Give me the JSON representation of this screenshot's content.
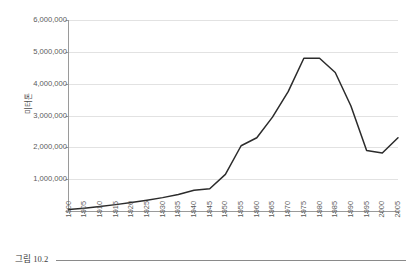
{
  "figure": {
    "caption_label": "그림 10.2",
    "background_color": "#ffffff",
    "line_color": "#2b2b2b",
    "grid_color": "#e2e2e2",
    "axis_color": "#9a9a9a",
    "tick_text_color": "#5a5a5a"
  },
  "chart_data": {
    "type": "line",
    "title": "",
    "subtitle": "",
    "xlabel": "",
    "ylabel": "미터톤",
    "xlim": [
      1900,
      2005
    ],
    "ylim": [
      0,
      6000000
    ],
    "grid": true,
    "legend": false,
    "legend_position": "none",
    "y_ticks": [
      0,
      1000000,
      2000000,
      3000000,
      4000000,
      5000000,
      6000000
    ],
    "y_tick_labels": [
      "",
      "1,000,000",
      "2,000,000",
      "3,000,000",
      "4,000,000",
      "5,000,000",
      "6,000,000"
    ],
    "x": [
      1900,
      1905,
      1910,
      1915,
      1920,
      1925,
      1930,
      1935,
      1940,
      1945,
      1950,
      1955,
      1960,
      1965,
      1970,
      1975,
      1980,
      1985,
      1990,
      1995,
      2000,
      2005
    ],
    "categories": [
      "1900",
      "1905",
      "1910",
      "1915",
      "1920",
      "1925",
      "1930",
      "1935",
      "1940",
      "1945",
      "1950",
      "1955",
      "1960",
      "1965",
      "1970",
      "1975",
      "1980",
      "1985",
      "1990",
      "1995",
      "2000",
      "2005"
    ],
    "values": [
      50000,
      90000,
      140000,
      200000,
      270000,
      340000,
      420000,
      520000,
      650000,
      700000,
      1150000,
      2050000,
      2300000,
      2950000,
      3750000,
      4800000,
      4800000,
      4350000,
      3300000,
      1900000,
      1820000,
      2300000
    ],
    "series": [
      {
        "name": "미터톤",
        "color": "#2b2b2b",
        "values": [
          50000,
          90000,
          140000,
          200000,
          270000,
          340000,
          420000,
          520000,
          650000,
          700000,
          1150000,
          2050000,
          2300000,
          2950000,
          3750000,
          4800000,
          4800000,
          4350000,
          3300000,
          1900000,
          1820000,
          2300000
        ]
      }
    ],
    "annotations": []
  }
}
